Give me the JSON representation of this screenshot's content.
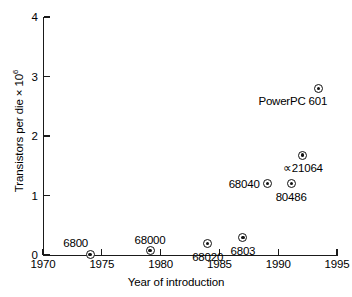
{
  "chart_data": {
    "type": "scatter",
    "title": "",
    "xlabel": "Year of introduction",
    "ylabel": "Transistors per die × 10⁶",
    "ylabel_base": "Transistors per die × 10",
    "ylabel_exponent": "6",
    "xlim": [
      1970,
      1995
    ],
    "ylim": [
      0,
      4
    ],
    "grid": false,
    "legend": "none",
    "xticks": [
      1970,
      1975,
      1980,
      1985,
      1990,
      1995
    ],
    "xtick_labels": [
      "1970",
      "1975",
      "1980",
      "1985",
      "1990",
      "1995"
    ],
    "yticks": [
      0,
      1,
      2,
      3,
      4
    ],
    "ytick_labels": [
      "0",
      "1",
      "2",
      "3",
      "4"
    ],
    "marker_style": "circle-with-center-dot",
    "points": [
      {
        "label": "6800",
        "x": 1974.0,
        "y": 0.01,
        "label_pos": "above-left"
      },
      {
        "label": "68000",
        "x": 1979.1,
        "y": 0.07,
        "label_pos": "above-center"
      },
      {
        "label": "68020",
        "x": 1984.0,
        "y": 0.19,
        "label_pos": "below-center"
      },
      {
        "label": "6803",
        "x": 1987.0,
        "y": 0.29,
        "label_pos": "below-center"
      },
      {
        "label": "68040",
        "x": 1989.1,
        "y": 1.2,
        "label_pos": "left"
      },
      {
        "label": "80486",
        "x": 1991.1,
        "y": 1.2,
        "label_pos": "below-center"
      },
      {
        "label": "∝21064",
        "x": 1992.1,
        "y": 1.68,
        "label_pos": "below-center"
      },
      {
        "label": "PowerPC 601",
        "x": 1993.4,
        "y": 2.8,
        "label_pos": "below-right"
      }
    ]
  },
  "figure": {
    "background_color": "#ffffff",
    "axis_color": "#1a1a1a",
    "marker_color": "#111111",
    "text_color": "#000000"
  }
}
